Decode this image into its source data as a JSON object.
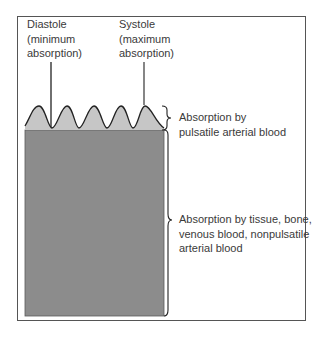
{
  "labels": {
    "diastole": "Diastole\n(minimum\nabsorption)",
    "systole": "Systole\n(maximum\nabsorption)",
    "pulsatile": "Absorption by\npulsatile arterial blood",
    "nonpulsatile": "Absorption by tissue, bone,\nvenous blood, nonpulsatile\narterial blood"
  },
  "colors": {
    "frame": "#555555",
    "pulsatile_fill": "#c6c6c6",
    "baseline_fill": "#8c8c8c",
    "line": "#333333",
    "text": "#3a3a3a"
  }
}
